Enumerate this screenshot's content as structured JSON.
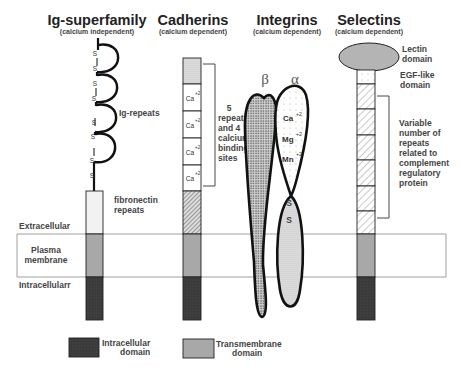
{
  "figure": {
    "families": [
      {
        "title": "Ig-superfamily",
        "subtitle": "(calcium independent)"
      },
      {
        "title": "Cadherins",
        "subtitle": "(calcium dependent)"
      },
      {
        "title": "Integrins",
        "subtitle": "(calcium dependent)"
      },
      {
        "title": "Selectins",
        "subtitle": "(calcium dependent)"
      }
    ],
    "regions": {
      "extracellular": "Extracellular",
      "membrane_line1": "Plasma",
      "membrane_line2": "membrane",
      "intracellular": "Intracellularr"
    },
    "ig": {
      "disulfide": "S",
      "repeats_label": "Ig-repeats",
      "fibronectin_line1": "fibronectin",
      "fibronectin_line2": "repeats"
    },
    "cadherin": {
      "ion": "Ca",
      "charge": "+2",
      "note": [
        "5",
        "repeats",
        "and 4",
        "calcium",
        "binding",
        "sites"
      ]
    },
    "integrin": {
      "beta": "β",
      "alpha": "α",
      "ions": [
        {
          "ion": "Ca",
          "charge": "+2"
        },
        {
          "ion": "Mg",
          "charge": "+2"
        },
        {
          "ion": "Mn",
          "charge": "+2"
        }
      ],
      "disulfide": "S"
    },
    "selectin": {
      "lectin_line1": "Lectin",
      "lectin_line2": "domain",
      "egf_line1": "EGF-like",
      "egf_line2": "domain",
      "note": [
        "Variable",
        "number of",
        "repeats",
        "related to",
        "complement",
        "regulatory",
        "protein"
      ]
    },
    "legend": {
      "intracellular_line1": "Intracellular",
      "intracellular_line2": "domain",
      "transmembrane_line1": "Transmembrane",
      "transmembrane_line2": "domain"
    },
    "colors": {
      "intracellular": "#3a3a3a",
      "transmembrane": "#a8a8a8",
      "lectin": "#b4b4b4",
      "outline": "#111111"
    }
  }
}
